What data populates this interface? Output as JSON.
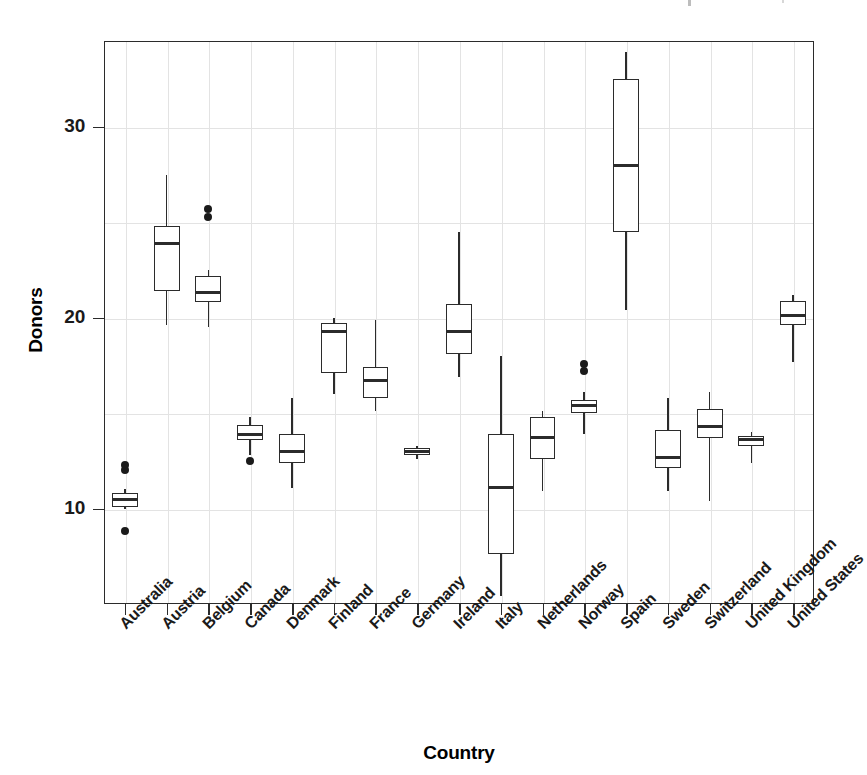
{
  "chart_data": {
    "type": "box",
    "title": "",
    "xlabel": "Country",
    "ylabel": "Donors",
    "ylim": [
      5,
      34.5
    ],
    "yticks": [
      10,
      20,
      30
    ],
    "ytick_labels": [
      "10",
      "20",
      "30"
    ],
    "grid": true,
    "legend": "none",
    "categories": [
      "Australia",
      "Austria",
      "Belgium",
      "Canada",
      "Denmark",
      "Finland",
      "France",
      "Germany",
      "Ireland",
      "Italy",
      "Netherlands",
      "Norway",
      "Spain",
      "Sweden",
      "Switzerland",
      "United Kingdom",
      "United States"
    ],
    "boxes": [
      {
        "category": "Australia",
        "whisker_low": 10.0,
        "q1": 10.1,
        "median": 10.5,
        "q3": 10.8,
        "whisker_high": 11.0,
        "outliers": [
          12.0,
          12.3,
          8.8
        ]
      },
      {
        "category": "Austria",
        "whisker_low": 19.6,
        "q1": 21.4,
        "median": 23.9,
        "q3": 24.8,
        "whisker_high": 27.5,
        "outliers": []
      },
      {
        "category": "Belgium",
        "whisker_low": 19.5,
        "q1": 20.8,
        "median": 21.3,
        "q3": 22.2,
        "whisker_high": 22.5,
        "outliers": [
          25.3,
          25.7
        ]
      },
      {
        "category": "Canada",
        "whisker_low": 12.8,
        "q1": 13.6,
        "median": 13.9,
        "q3": 14.4,
        "whisker_high": 14.8,
        "outliers": [
          12.5
        ]
      },
      {
        "category": "Denmark",
        "whisker_low": 11.1,
        "q1": 12.4,
        "median": 13.0,
        "q3": 13.9,
        "whisker_high": 15.8,
        "outliers": []
      },
      {
        "category": "Finland",
        "whisker_low": 16.0,
        "q1": 17.1,
        "median": 19.3,
        "q3": 19.7,
        "whisker_high": 20.0,
        "outliers": []
      },
      {
        "category": "France",
        "whisker_low": 15.1,
        "q1": 15.8,
        "median": 16.7,
        "q3": 17.4,
        "whisker_high": 19.9,
        "outliers": []
      },
      {
        "category": "Germany",
        "whisker_low": 12.6,
        "q1": 12.8,
        "median": 13.0,
        "q3": 13.2,
        "whisker_high": 13.3,
        "outliers": []
      },
      {
        "category": "Ireland",
        "whisker_low": 16.9,
        "q1": 18.1,
        "median": 19.3,
        "q3": 20.7,
        "whisker_high": 24.5,
        "outliers": []
      },
      {
        "category": "Italy",
        "whisker_low": 5.4,
        "q1": 7.6,
        "median": 11.1,
        "q3": 13.9,
        "whisker_high": 18.0,
        "outliers": []
      },
      {
        "category": "Netherlands",
        "whisker_low": 10.9,
        "q1": 12.6,
        "median": 13.7,
        "q3": 14.8,
        "whisker_high": 15.1,
        "outliers": []
      },
      {
        "category": "Norway",
        "whisker_low": 13.9,
        "q1": 15.0,
        "median": 15.4,
        "q3": 15.7,
        "whisker_high": 16.1,
        "outliers": [
          17.2,
          17.6
        ]
      },
      {
        "category": "Spain",
        "whisker_low": 20.4,
        "q1": 24.5,
        "median": 28.0,
        "q3": 32.5,
        "whisker_high": 33.9,
        "outliers": []
      },
      {
        "category": "Sweden",
        "whisker_low": 10.9,
        "q1": 12.1,
        "median": 12.7,
        "q3": 14.1,
        "whisker_high": 15.8,
        "outliers": []
      },
      {
        "category": "Switzerland",
        "whisker_low": 10.4,
        "q1": 13.7,
        "median": 14.3,
        "q3": 15.2,
        "whisker_high": 16.1,
        "outliers": []
      },
      {
        "category": "United Kingdom",
        "whisker_low": 12.4,
        "q1": 13.3,
        "median": 13.6,
        "q3": 13.8,
        "whisker_high": 14.0,
        "outliers": []
      },
      {
        "category": "United States",
        "whisker_low": 17.7,
        "q1": 19.6,
        "median": 20.1,
        "q3": 20.9,
        "whisker_high": 21.2,
        "outliers": []
      }
    ]
  },
  "axes": {
    "y_title": "Donors",
    "x_title": "Country"
  }
}
